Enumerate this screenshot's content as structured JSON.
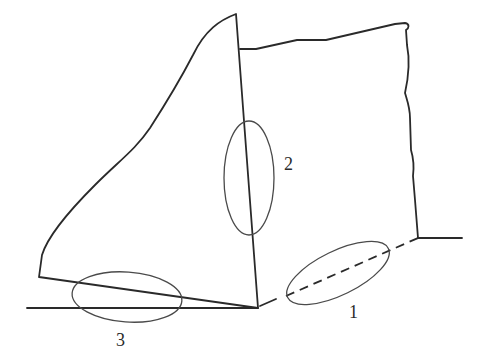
{
  "diagram": {
    "type": "line drawing",
    "stroke_color": "#2a2a2a",
    "background": "#ffffff",
    "labels": [
      {
        "id": "1",
        "text": "1",
        "target": "dashed extension line between the two bodies"
      },
      {
        "id": "2",
        "text": "2",
        "target": "inclined interface line between the two bodies"
      },
      {
        "id": "3",
        "text": "3",
        "target": "base line under the left body's lower edge"
      }
    ]
  }
}
